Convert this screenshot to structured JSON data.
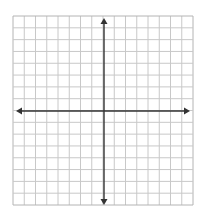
{
  "diagram": {
    "type": "coordinate-plane",
    "grid": {
      "columns": 16,
      "rows": 16,
      "left": 13,
      "top": 16,
      "right": 193,
      "bottom": 205,
      "line_color": "#c8c8c8",
      "border_color": "#b4b4b4"
    },
    "axes": {
      "x_axis_y": 111,
      "y_axis_x": 104,
      "color": "#333333",
      "arrows": [
        "left",
        "right",
        "up",
        "down"
      ],
      "x_axis_extent": [
        16,
        190
      ],
      "y_axis_extent": [
        18,
        205
      ]
    }
  }
}
